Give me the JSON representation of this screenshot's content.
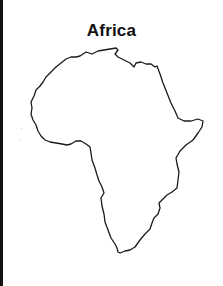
{
  "title": "Africa",
  "map": {
    "subject": "Africa continent outline",
    "style": "black outline on white, no fill",
    "outline_color": "#1a1a1a",
    "background_color": "#ffffff",
    "frame_strip_color": "#111111",
    "features_visible": [
      "Mediterranean coast",
      "Nile delta notch",
      "Red Sea coast",
      "Horn of Africa",
      "East coast",
      "Cape of Good Hope",
      "Gulf of Guinea",
      "West African bulge"
    ]
  }
}
